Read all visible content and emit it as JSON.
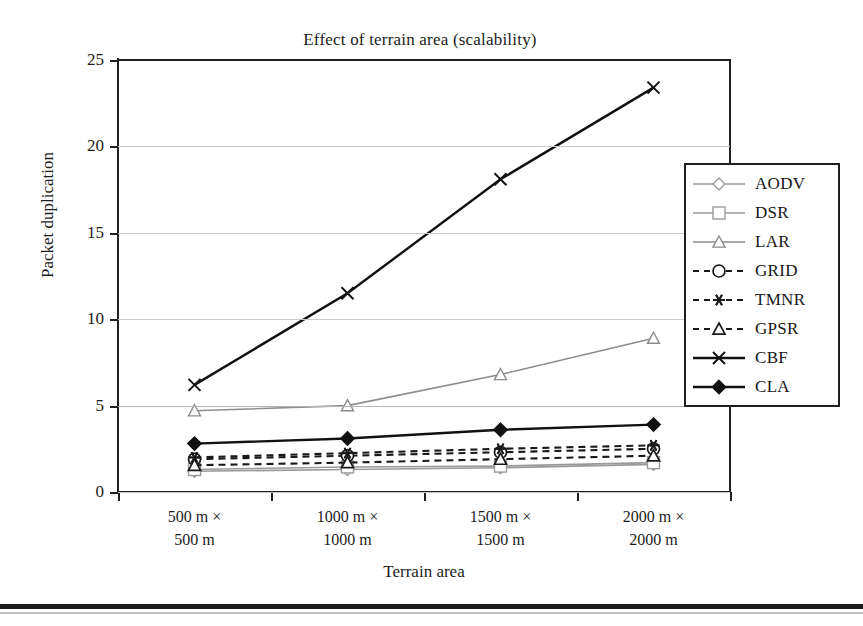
{
  "figure": {
    "title": "Effect of terrain area (scalability)",
    "x_axis_title": "Terrain area",
    "y_axis_title": "Packet duplication"
  },
  "chart_data": {
    "type": "line",
    "title": "Effect of terrain area (scalability)",
    "xlabel": "Terrain area",
    "ylabel": "Packet duplication",
    "ylim": [
      0,
      25
    ],
    "yticks": [
      0,
      5,
      10,
      15,
      20,
      25
    ],
    "grid": true,
    "legend_position": "right",
    "categories": [
      "500 m × 500 m",
      "1000 m × 1000 m",
      "1500 m × 1500 m",
      "2000 m × 2000 m"
    ],
    "category_lines": [
      [
        "500 m ×",
        "500 m"
      ],
      [
        "1000 m ×",
        "1000 m"
      ],
      [
        "1500 m ×",
        "1500 m"
      ],
      [
        "2000 m ×",
        "2000 m"
      ]
    ],
    "series": [
      {
        "name": "AODV",
        "marker": "diamond-open",
        "line": "solid",
        "color": "#9a9a9a",
        "values": [
          1.2,
          1.3,
          1.4,
          1.6
        ]
      },
      {
        "name": "DSR",
        "marker": "square-open",
        "line": "solid",
        "color": "#9a9a9a",
        "values": [
          1.3,
          1.45,
          1.5,
          1.7
        ]
      },
      {
        "name": "LAR",
        "marker": "triangle-open",
        "line": "solid",
        "color": "#8c8c8c",
        "values": [
          4.7,
          5.0,
          6.8,
          8.9
        ]
      },
      {
        "name": "GRID",
        "marker": "circle-open",
        "line": "dashed",
        "color": "#1a1a1a",
        "values": [
          1.9,
          2.1,
          2.3,
          2.5
        ]
      },
      {
        "name": "TMNR",
        "marker": "asterisk",
        "line": "dashed",
        "color": "#1a1a1a",
        "values": [
          2.0,
          2.25,
          2.5,
          2.7
        ]
      },
      {
        "name": "GPSR",
        "marker": "triangle-open",
        "line": "dashed",
        "color": "#1a1a1a",
        "values": [
          1.55,
          1.7,
          1.9,
          2.1
        ]
      },
      {
        "name": "CBF",
        "marker": "cross",
        "line": "solid",
        "color": "#111111",
        "values": [
          6.2,
          11.5,
          18.1,
          23.4
        ]
      },
      {
        "name": "CLA",
        "marker": "diamond-filled",
        "line": "solid",
        "color": "#111111",
        "values": [
          2.8,
          3.1,
          3.6,
          3.9
        ]
      }
    ]
  },
  "legend": {
    "items": [
      {
        "label": "AODV"
      },
      {
        "label": "DSR"
      },
      {
        "label": "LAR"
      },
      {
        "label": "GRID"
      },
      {
        "label": "TMNR"
      },
      {
        "label": "GPSR"
      },
      {
        "label": "CBF"
      },
      {
        "label": "CLA"
      }
    ]
  }
}
